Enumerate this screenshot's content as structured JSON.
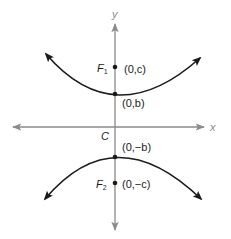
{
  "diagram": {
    "type": "hyperbola-vertical-transverse-axis",
    "axes": {
      "x_label": "x",
      "y_label": "y",
      "color": "#8a8a8a"
    },
    "center": {
      "label": "C"
    },
    "foci": [
      {
        "name": "F",
        "sub": "1",
        "coord": "(0,c)"
      },
      {
        "name": "F",
        "sub": "2",
        "coord": "(0,−c)"
      }
    ],
    "vertices": [
      {
        "coord": "(0,b)"
      },
      {
        "coord": "(0,−b)"
      }
    ],
    "curve_color": "#1a1a1a"
  }
}
